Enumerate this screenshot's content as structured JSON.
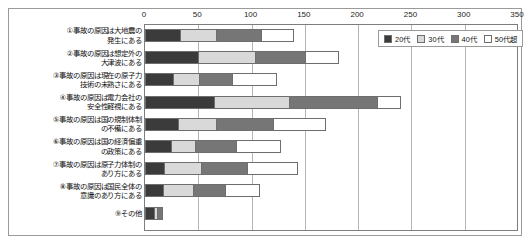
{
  "chart_data": {
    "type": "bar",
    "orientation": "horizontal",
    "stacked": true,
    "title": "",
    "subtitle": "",
    "xlabel": "",
    "ylabel": "",
    "xlim": [
      0,
      350
    ],
    "xticks": [
      0,
      50,
      100,
      150,
      200,
      250,
      300,
      350
    ],
    "xtick_labels": [
      "0",
      "50",
      "100",
      "150",
      "200",
      "250",
      "300",
      "350"
    ],
    "grid": true,
    "grid_axis": "x",
    "axis_position": "top",
    "legend_position": "top-right-inside",
    "categories": [
      "①事故の原因は大地震の\n発生にある",
      "②事故の原因は想定外の\n大津波にある",
      "③事故の原因は現在の原子力\n技術の未熟さにある",
      "④事故の原因は電力会社の\n安全性軽視にある",
      "⑤事故の原因は国の規制体制\nの不備にある",
      "⑥事故の原因は国の経済偏重\nの政策にある",
      "⑦事故の原因は原子力体制の\nあり方にある",
      "⑧事故の原因は国民全体の\n意識のあり方にある",
      "⑨その他"
    ],
    "series": [
      {
        "name": "20代",
        "color": "#3b3b3b",
        "values": [
          33,
          50,
          26,
          65,
          31,
          24,
          18,
          17,
          8
        ]
      },
      {
        "name": "30代",
        "color": "#d9d9d9",
        "values": [
          34,
          53,
          25,
          70,
          36,
          23,
          35,
          28,
          3
        ]
      },
      {
        "name": "40代",
        "color": "#767676",
        "values": [
          42,
          47,
          31,
          83,
          53,
          38,
          43,
          30,
          6
        ]
      },
      {
        "name": "50代超",
        "color": "#ffffff",
        "values": [
          31,
          32,
          42,
          22,
          50,
          43,
          48,
          33,
          0
        ]
      }
    ],
    "totals": [
      140,
      182,
      124,
      240,
      170,
      128,
      144,
      108,
      17
    ]
  },
  "legend": {
    "items": [
      {
        "label": "20代",
        "color": "#3b3b3b"
      },
      {
        "label": "30代",
        "color": "#d9d9d9"
      },
      {
        "label": "40代",
        "color": "#767676"
      },
      {
        "label": "50代超",
        "color": "#ffffff"
      }
    ]
  }
}
